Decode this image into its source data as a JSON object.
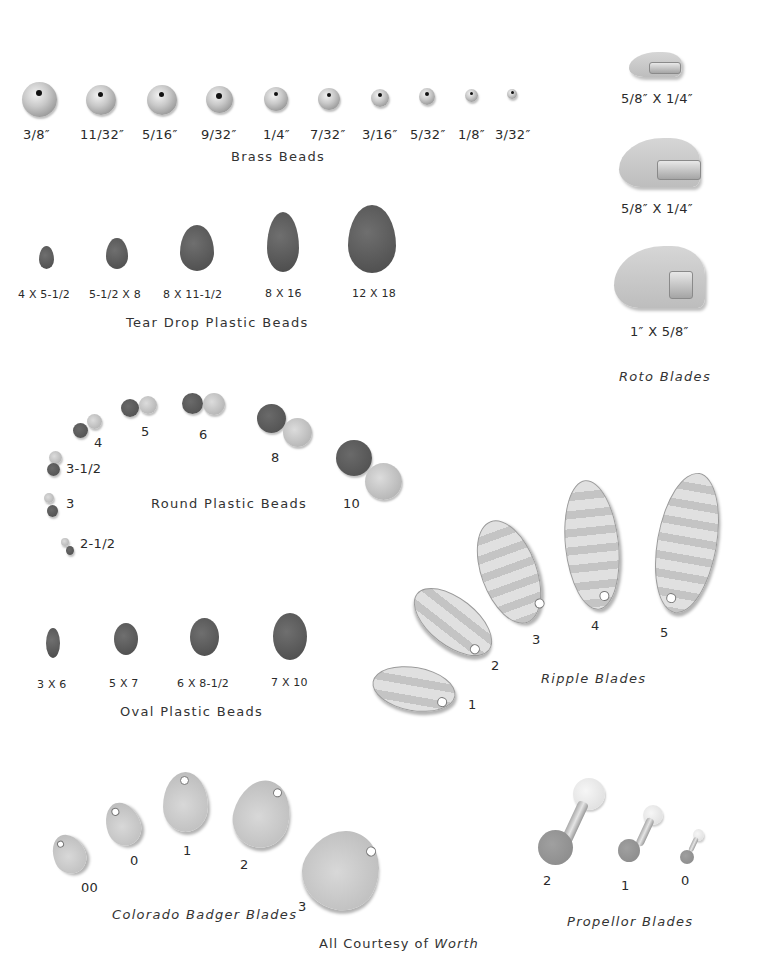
{
  "brass_beads": {
    "title": "Brass Beads",
    "sizes": [
      "3/8″",
      "11/32″",
      "5/16″",
      "9/32″",
      "1/4″",
      "7/32″",
      "3/16″",
      "5/32″",
      "1/8″",
      "3/32″"
    ]
  },
  "tear_drop_beads": {
    "title": "Tear Drop Plastic Beads",
    "sizes": [
      "4 X 5-1/2",
      "5-1/2 X 8",
      "8 X 11-1/2",
      "8 X 16",
      "12 X 18"
    ]
  },
  "round_beads": {
    "title": "Round Plastic Beads",
    "sizes": [
      "2-1/2",
      "3",
      "3-1/2",
      "4",
      "5",
      "6",
      "8",
      "10"
    ]
  },
  "oval_beads": {
    "title": "Oval Plastic Beads",
    "sizes": [
      "3 X 6",
      "5 X 7",
      "6 X 8-1/2",
      "7 X 10"
    ]
  },
  "roto_blades": {
    "title": "Roto Blades",
    "sizes": [
      "5/8″ X 1/4″",
      "5/8″ X 1/4″",
      "1″ X 5/8″"
    ]
  },
  "ripple_blades": {
    "title": "Ripple Blades",
    "sizes": [
      "1",
      "2",
      "3",
      "4",
      "5"
    ]
  },
  "colorado_badger_blades": {
    "title": "Colorado Badger Blades",
    "sizes": [
      "00",
      "0",
      "1",
      "2",
      "3"
    ]
  },
  "propellor_blades": {
    "title": "Propellor Blades",
    "sizes": [
      "2",
      "1",
      "0"
    ]
  },
  "credit": {
    "prefix": "All Courtesy of ",
    "brand": "Worth"
  },
  "colors": {
    "background": "#ffffff",
    "text": "#2a2a2a",
    "dark_bead": "#555555",
    "light_bead": "#c8c8c8",
    "metal": "#bdbdbd"
  }
}
